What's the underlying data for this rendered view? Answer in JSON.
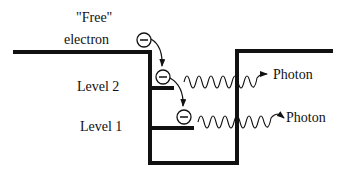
{
  "diagram": {
    "labels": {
      "free_line1": "\"Free\"",
      "free_line2": "electron",
      "level2": "Level 2",
      "level1": "Level 1",
      "photon_upper": "Photon",
      "photon_lower": "Photon"
    },
    "electron_symbol": "minus-in-circle",
    "colors": {
      "ink": "#111111",
      "background": "#ffffff"
    }
  }
}
